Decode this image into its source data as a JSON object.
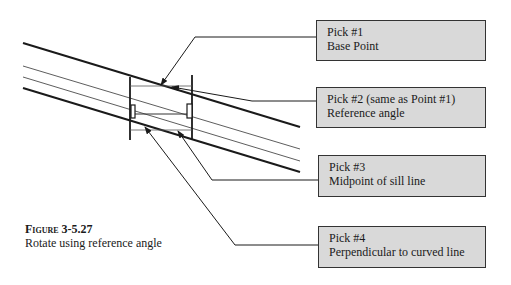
{
  "callouts": [
    {
      "id": "pick1",
      "line1": "Pick #1",
      "line2": "Base Point"
    },
    {
      "id": "pick2",
      "line1": "Pick #2 (same as Point #1)",
      "line2": "Reference angle"
    },
    {
      "id": "pick3",
      "line1": "Pick #3",
      "line2": "Midpoint of sill line"
    },
    {
      "id": "pick4",
      "line1": "Pick #4",
      "line2": "Perpendicular to curved line"
    }
  ],
  "caption": {
    "figure": "Figure 3-5.27",
    "description": "Rotate using reference angle"
  },
  "colors": {
    "callout_fill": "#d9d9d9",
    "line": "#1a1a1a"
  }
}
